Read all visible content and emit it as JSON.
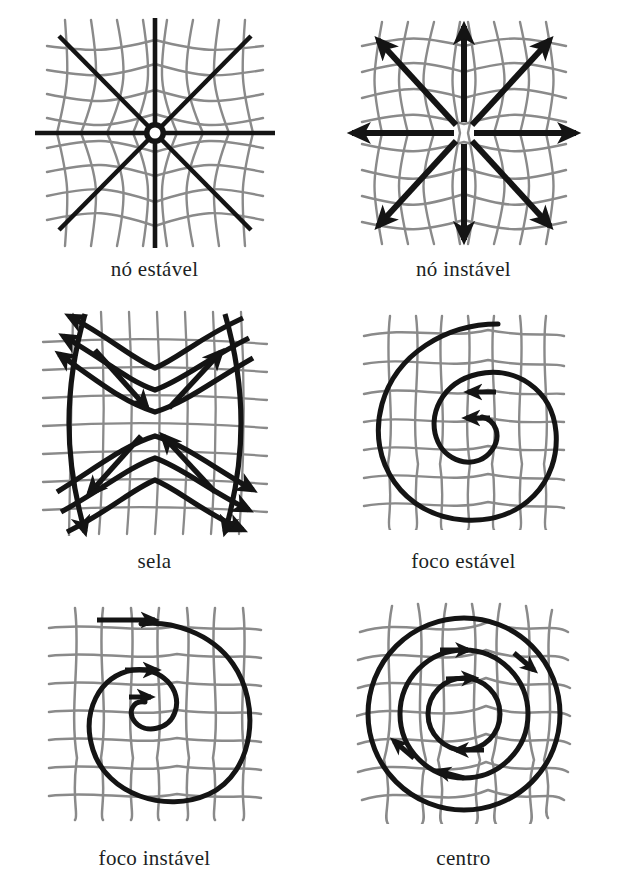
{
  "figure": {
    "kind": "phase-portrait-plate",
    "language": "pt-BR",
    "background_color": "#ffffff",
    "grid_color": "#8a8a8a",
    "curve_color": "#141414",
    "caption_color": "#201f1f",
    "columns": 2,
    "rows": 3,
    "panel_count": 6
  },
  "panels": [
    {
      "id": "no-estavel",
      "caption": "nó estável",
      "english": "stable node",
      "row": 1,
      "column": 1,
      "flow": "inward",
      "trajectory_style": "straight-rays",
      "arrow_count": 0,
      "grid_deformation": "pinched-inward"
    },
    {
      "id": "no-instavel",
      "caption": "nó instável",
      "english": "unstable node",
      "row": 1,
      "column": 2,
      "flow": "outward",
      "trajectory_style": "straight-rays-with-arrowheads",
      "arrow_count": 8,
      "grid_deformation": "bulged-outward"
    },
    {
      "id": "sela",
      "caption": "sela",
      "english": "saddle",
      "row": 2,
      "column": 1,
      "flow": "hyperbolic",
      "trajectory_style": "hyperbolas-plus-separatrices",
      "arrow_count": 12,
      "grid_deformation": "saddle-warped"
    },
    {
      "id": "foco-estavel",
      "caption": "foco estável",
      "english": "stable focus",
      "row": 2,
      "column": 2,
      "flow": "inward-spiral",
      "spiral_direction": "clockwise",
      "trajectory_style": "spiral",
      "arrow_count": 2,
      "grid_deformation": "wavy"
    },
    {
      "id": "foco-instavel",
      "caption": "foco instável",
      "english": "unstable focus",
      "row": 3,
      "column": 1,
      "flow": "outward-spiral",
      "spiral_direction": "clockwise",
      "trajectory_style": "spiral",
      "arrow_count": 3,
      "grid_deformation": "wavy"
    },
    {
      "id": "centro",
      "caption": "centro",
      "english": "center",
      "row": 3,
      "column": 2,
      "flow": "closed-orbits",
      "orbit_direction": "clockwise",
      "trajectory_style": "concentric-circles",
      "orbit_count": 3,
      "arrow_count": 6,
      "grid_deformation": "radially-warped"
    }
  ]
}
